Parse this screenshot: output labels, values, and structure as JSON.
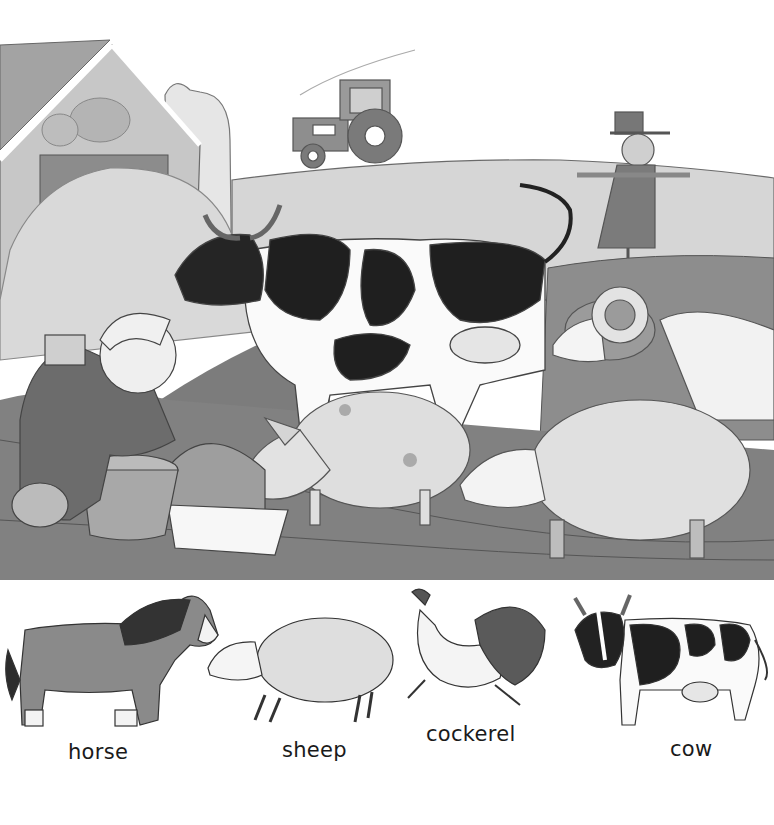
{
  "scene": {
    "title": "farmyard-scene",
    "elements": [
      "barn",
      "silo",
      "haystack",
      "tractor",
      "scarecrow",
      "field",
      "cow",
      "ram",
      "child",
      "bucket",
      "trough",
      "pig",
      "sheep",
      "mud"
    ]
  },
  "animals": [
    {
      "label": "horse",
      "x": 68,
      "y": 740
    },
    {
      "label": "sheep",
      "x": 282,
      "y": 738
    },
    {
      "label": "cockerel",
      "x": 426,
      "y": 722
    },
    {
      "label": "cow",
      "x": 670,
      "y": 737
    }
  ],
  "colors": {
    "background": "#ffffff",
    "ink": "#2a2a2a",
    "mid_gray": "#8a8a8a",
    "light_gray": "#c9c9c9",
    "dark_patch": "#1e1e1e",
    "mud": "#7d7d7d"
  }
}
